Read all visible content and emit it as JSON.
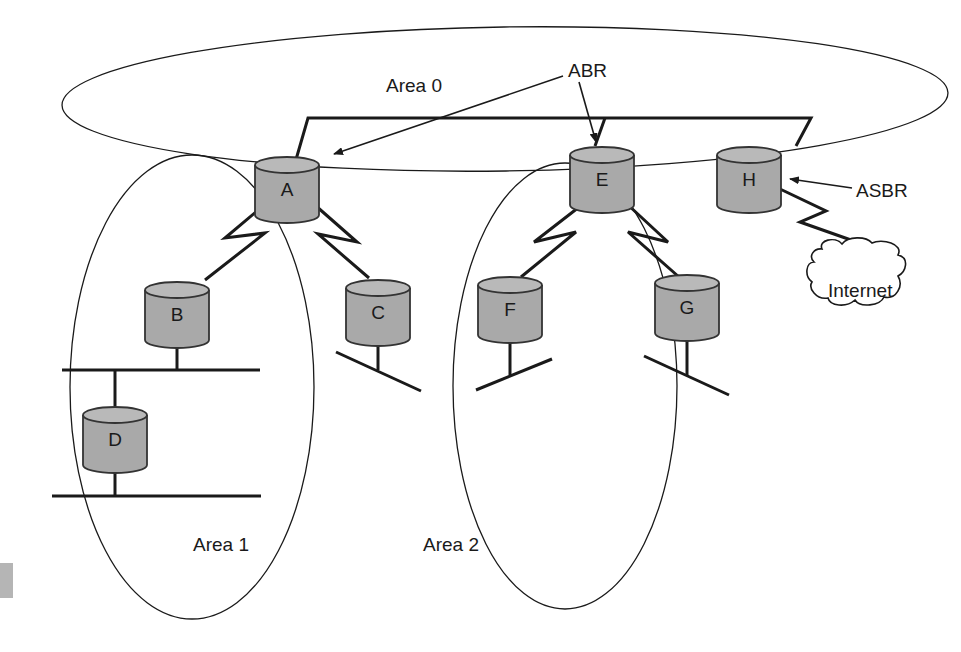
{
  "diagram": {
    "areas": [
      {
        "id": "area0",
        "label": "Area 0"
      },
      {
        "id": "area1",
        "label": "Area 1"
      },
      {
        "id": "area2",
        "label": "Area 2"
      }
    ],
    "routers": [
      {
        "id": "A",
        "label": "A",
        "area": "Area 0 / Area 1",
        "role": "ABR"
      },
      {
        "id": "B",
        "label": "B",
        "area": "Area 1"
      },
      {
        "id": "C",
        "label": "C",
        "area": "Area 1"
      },
      {
        "id": "D",
        "label": "D",
        "area": "Area 1"
      },
      {
        "id": "E",
        "label": "E",
        "area": "Area 0 / Area 2",
        "role": "ABR"
      },
      {
        "id": "F",
        "label": "F",
        "area": "Area 2"
      },
      {
        "id": "G",
        "label": "G",
        "area": "Area 2"
      },
      {
        "id": "H",
        "label": "H",
        "area": "Area 0",
        "role": "ASBR"
      }
    ],
    "external": {
      "label": "Internet",
      "shape": "cloud"
    },
    "callouts": [
      {
        "label": "ABR",
        "points_to": [
          "A",
          "E"
        ]
      },
      {
        "label": "ASBR",
        "points_to": [
          "H"
        ]
      }
    ],
    "links": [
      {
        "from": "A",
        "to": "E",
        "type": "backbone-lan"
      },
      {
        "from": "E",
        "to": "H",
        "type": "backbone-lan"
      },
      {
        "from": "A",
        "to": "B",
        "type": "serial"
      },
      {
        "from": "A",
        "to": "C",
        "type": "serial"
      },
      {
        "from": "E",
        "to": "F",
        "type": "serial"
      },
      {
        "from": "E",
        "to": "G",
        "type": "serial"
      },
      {
        "from": "H",
        "to": "Internet",
        "type": "serial"
      },
      {
        "from": "B",
        "to": "D",
        "type": "lan"
      },
      {
        "from": "D",
        "to": "lan-segment",
        "type": "lan"
      },
      {
        "from": "C",
        "to": "lan-segment",
        "type": "lan"
      },
      {
        "from": "F",
        "to": "lan-segment",
        "type": "lan"
      },
      {
        "from": "G",
        "to": "lan-segment",
        "type": "lan"
      }
    ],
    "icon_semantics": {
      "router": "router-cylinder-icon",
      "serial": "serial-link-zigzag-icon",
      "cloud": "internet-cloud-icon"
    }
  }
}
